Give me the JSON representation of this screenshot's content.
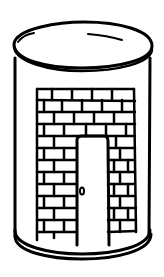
{
  "image": {
    "description": "Line drawing of a cylindrical can with a brick wall and a doorway drawn on its side",
    "subject": "can-with-brick-door",
    "colors": {
      "background": "#ffffff",
      "ink": "#000000"
    }
  },
  "illustration": {
    "lid": "elliptical top lid",
    "body": "cylinder body",
    "wall": "brick wall pattern",
    "door": "open doorway",
    "doorknob": "oval doorknob",
    "base": "rounded bottom rim"
  }
}
